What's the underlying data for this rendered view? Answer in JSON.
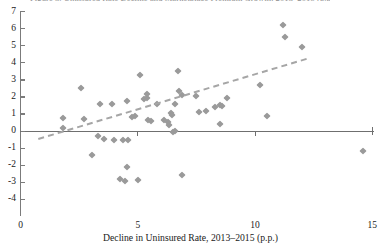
{
  "chart_data": {
    "type": "scatter",
    "title": "",
    "title_clipped": "Figure 3. Uninsured Rate Decline and Marketplace Premium Growth, 2013–2015 (p.p.)",
    "xlabel": "Decline in Uninsured Rate, 2013–2015 (p.p.)",
    "ylabel": "",
    "xlim": [
      0,
      15
    ],
    "ylim": [
      -4,
      7
    ],
    "xticks": [
      0,
      5,
      10,
      15
    ],
    "xticklabels": [
      "0",
      "5",
      "10",
      "15"
    ],
    "yticks": [
      -4,
      -3,
      -2,
      -1,
      0,
      1,
      2,
      3,
      4,
      5,
      6,
      7
    ],
    "yticklabels": [
      "-4",
      "-3",
      "-2",
      "-1",
      "0",
      "1",
      "2",
      "3",
      "4",
      "5",
      "6",
      "7"
    ],
    "grid": false,
    "legend": false,
    "marker": "diamond",
    "marker_color": "#9a9a9a",
    "trendline": {
      "style": "dashed",
      "color": "#a6a6a6",
      "x_start": 0.75,
      "y_start": -0.4,
      "x_end": 12.2,
      "y_end": 4.3
    },
    "points": [
      {
        "x": 1.8,
        "y": 0.75
      },
      {
        "x": 1.8,
        "y": 0.15
      },
      {
        "x": 2.7,
        "y": 0.7
      },
      {
        "x": 2.6,
        "y": 2.5
      },
      {
        "x": 3.3,
        "y": -0.3
      },
      {
        "x": 3.55,
        "y": -0.45
      },
      {
        "x": 3.4,
        "y": 1.6
      },
      {
        "x": 3.9,
        "y": 1.6
      },
      {
        "x": 4.0,
        "y": -0.5
      },
      {
        "x": 4.35,
        "y": -0.5
      },
      {
        "x": 4.6,
        "y": -0.5
      },
      {
        "x": 3.05,
        "y": -1.4
      },
      {
        "x": 4.55,
        "y": 1.75
      },
      {
        "x": 4.75,
        "y": 0.8
      },
      {
        "x": 4.9,
        "y": 0.9
      },
      {
        "x": 5.1,
        "y": 3.3
      },
      {
        "x": 5.25,
        "y": 1.9
      },
      {
        "x": 5.4,
        "y": 2.15
      },
      {
        "x": 5.4,
        "y": 1.95
      },
      {
        "x": 5.45,
        "y": 0.65
      },
      {
        "x": 5.55,
        "y": 0.6
      },
      {
        "x": 5.8,
        "y": 1.6
      },
      {
        "x": 4.55,
        "y": -2.1
      },
      {
        "x": 4.25,
        "y": -2.8
      },
      {
        "x": 4.45,
        "y": -2.95
      },
      {
        "x": 5.0,
        "y": -2.85
      },
      {
        "x": 6.1,
        "y": 0.65
      },
      {
        "x": 6.3,
        "y": 0.55
      },
      {
        "x": 6.4,
        "y": 1.05
      },
      {
        "x": 6.45,
        "y": 0.95
      },
      {
        "x": 6.6,
        "y": 1.6
      },
      {
        "x": 6.7,
        "y": 3.5
      },
      {
        "x": 6.75,
        "y": 2.35
      },
      {
        "x": 6.9,
        "y": 2.1
      },
      {
        "x": 6.6,
        "y": 0.0
      },
      {
        "x": 6.5,
        "y": -0.05
      },
      {
        "x": 6.35,
        "y": 0.35
      },
      {
        "x": 6.9,
        "y": -2.6
      },
      {
        "x": 7.5,
        "y": 2.05
      },
      {
        "x": 7.6,
        "y": 1.1
      },
      {
        "x": 7.9,
        "y": 1.15
      },
      {
        "x": 8.3,
        "y": 1.4
      },
      {
        "x": 8.5,
        "y": 1.5
      },
      {
        "x": 8.6,
        "y": 1.45
      },
      {
        "x": 8.8,
        "y": 1.95
      },
      {
        "x": 8.5,
        "y": 0.4
      },
      {
        "x": 10.2,
        "y": 2.7
      },
      {
        "x": 10.5,
        "y": 0.9
      },
      {
        "x": 11.2,
        "y": 6.2
      },
      {
        "x": 11.3,
        "y": 5.5
      },
      {
        "x": 12.0,
        "y": 4.9
      },
      {
        "x": 14.6,
        "y": -1.2
      }
    ]
  }
}
